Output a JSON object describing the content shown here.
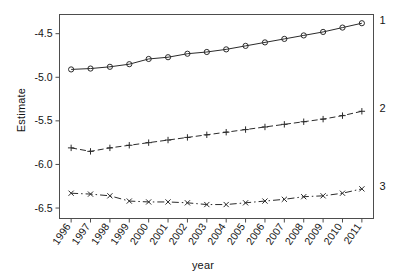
{
  "chart_data": {
    "type": "line",
    "title": "",
    "xlabel": "year",
    "ylabel": "Estimate",
    "grid": false,
    "legend_position": "right-inline-end-of-line",
    "x": [
      1996,
      1997,
      1998,
      1999,
      2000,
      2001,
      2002,
      2003,
      2004,
      2005,
      2006,
      2007,
      2008,
      2009,
      2010,
      2011
    ],
    "categories": [
      "1996",
      "1997",
      "1998",
      "1999",
      "2000",
      "2001",
      "2002",
      "2003",
      "2004",
      "2005",
      "2006",
      "2007",
      "2008",
      "2009",
      "2010",
      "2011"
    ],
    "xlim": [
      1995.4,
      2011.6
    ],
    "ylim": [
      -6.62,
      -4.28
    ],
    "yticks": [
      -4.5,
      -5.0,
      -5.5,
      -6.0,
      -6.5
    ],
    "ytick_labels": [
      "-4.5",
      "-5.0",
      "-5.5",
      "-6.0",
      "-6.5"
    ],
    "series": [
      {
        "name": "1",
        "label": "1",
        "marker": "circle",
        "linestyle": "solid",
        "color": "#2b2b2b",
        "values": [
          -4.91,
          -4.9,
          -4.88,
          -4.85,
          -4.79,
          -4.77,
          -4.73,
          -4.71,
          -4.68,
          -4.64,
          -4.6,
          -4.56,
          -4.52,
          -4.48,
          -4.43,
          -4.38
        ]
      },
      {
        "name": "2",
        "label": "2",
        "marker": "plus",
        "linestyle": "dashed",
        "color": "#2b2b2b",
        "values": [
          -5.81,
          -5.85,
          -5.81,
          -5.78,
          -5.75,
          -5.72,
          -5.69,
          -5.66,
          -5.63,
          -5.6,
          -5.57,
          -5.54,
          -5.51,
          -5.48,
          -5.44,
          -5.39
        ]
      },
      {
        "name": "3",
        "label": "3",
        "marker": "x",
        "linestyle": "dashdot",
        "color": "#2b2b2b",
        "values": [
          -6.33,
          -6.34,
          -6.36,
          -6.42,
          -6.43,
          -6.43,
          -6.44,
          -6.46,
          -6.46,
          -6.44,
          -6.42,
          -6.4,
          -6.37,
          -6.36,
          -6.33,
          -6.28
        ]
      }
    ]
  },
  "axes": {
    "y_title": "Estimate",
    "x_title": "year"
  }
}
